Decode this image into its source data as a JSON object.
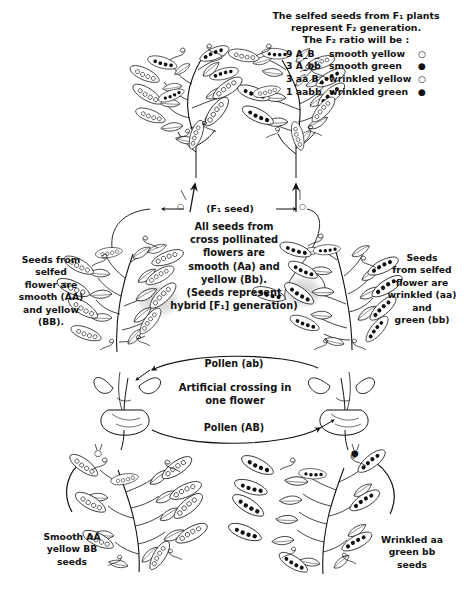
{
  "diagram": {
    "ink_color": "#111111",
    "paper_color": "#ffffff"
  },
  "f2_note": {
    "line1": "The selfed seeds from F₁ plants",
    "line2": "represent  F₂ generation.",
    "line3": "The F₂ ratio will be :",
    "ratio_rows": [
      {
        "count_genotype": "9 A_B_",
        "phenotype": "smooth yellow",
        "marker": "○"
      },
      {
        "count_genotype": "3 A_bb",
        "phenotype": "smooth green",
        "marker": "●"
      },
      {
        "count_genotype": "3 aa B_",
        "phenotype": "wrinkled yellow",
        "marker": "○"
      },
      {
        "count_genotype": "1 aabb",
        "phenotype": "wrinkled green",
        "marker": "●"
      }
    ]
  },
  "f1_seed_label": "(F₁ seed)",
  "center_note": {
    "line1": "All seeds from",
    "line2": "cross pollinated",
    "line3": "flowers are",
    "line4": "smooth (Aa) and",
    "line5": "yellow (Bb).",
    "line6": "(Seeds represent",
    "line7": "hybrid [F₁] generation)"
  },
  "left_note": {
    "line1": "Seeds from",
    "line2": "selfed",
    "line3": "flower are",
    "line4": "smooth (AA)",
    "line5": "and yellow",
    "line6": "(BB)."
  },
  "right_note": {
    "line1": "Seeds",
    "line2": "from selfed",
    "line3": "flower are",
    "line4": "wrinkled (aa)",
    "line5": "and",
    "line6": "green (bb)"
  },
  "pollen_top": "Pollen (ab)",
  "cross_note": {
    "line1": "Artificial crossing in",
    "line2": "one flower"
  },
  "pollen_bottom": "Pollen (AB)",
  "bottom_left_note": {
    "line1": "Smooth AA",
    "line2": "yellow BB",
    "line3": "seeds"
  },
  "bottom_right_note": {
    "line1": "Wrinkled aa",
    "line2": "green bb",
    "line3": "seeds"
  },
  "markers": {
    "open_circle": "○",
    "filled_circle": "●",
    "open_circle_name": "smooth-yellow-seed-marker",
    "filled_circle_name": "wrinkled-green-seed-marker"
  },
  "illustrations": [
    {
      "name": "f2-plant-left",
      "caption": "F2 pea plant with mixed smooth and wrinkled pods"
    },
    {
      "name": "f2-plant-right",
      "caption": "F2 pea plant with mixed smooth and wrinkled pods"
    },
    {
      "name": "f1-plant-left",
      "caption": "F1 hybrid plant, smooth yellow seeds"
    },
    {
      "name": "f1-plant-right",
      "caption": "F1 hybrid plant, wrinkled green seeds shown dark"
    },
    {
      "name": "flower-left-emasculated",
      "caption": "Pea flower opened for artificial crossing"
    },
    {
      "name": "flower-right-emasculated",
      "caption": "Pea flower opened for artificial crossing"
    },
    {
      "name": "parent-plant-smooth",
      "caption": "Parent plant: smooth AA yellow BB"
    },
    {
      "name": "parent-plant-wrinkled",
      "caption": "Parent plant: wrinkled aa green bb"
    }
  ]
}
